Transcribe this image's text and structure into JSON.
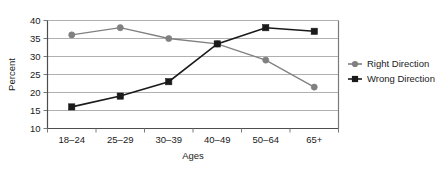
{
  "chart_data": {
    "type": "line",
    "title": "",
    "xlabel": "Ages",
    "ylabel": "Percent",
    "categories": [
      "18–24",
      "25–29",
      "30–39",
      "40–49",
      "50–64",
      "65+"
    ],
    "ylim": [
      10,
      40
    ],
    "ytick_step": 5,
    "yticks": [
      "10",
      "15",
      "20",
      "25",
      "30",
      "35",
      "40"
    ],
    "grid": "horizontal",
    "legend_position": "right",
    "series": [
      {
        "name": "Right Direction",
        "marker": "circle",
        "color": "#808080",
        "values": [
          36,
          38,
          35,
          33.5,
          29,
          21.5
        ]
      },
      {
        "name": "Wrong Direction",
        "marker": "square",
        "color": "#1a1a1a",
        "values": [
          16,
          19,
          23,
          33.5,
          38,
          37
        ]
      }
    ]
  },
  "legend": {
    "items": [
      {
        "label": "Right Direction",
        "marker": "circle-marker",
        "color": "#808080"
      },
      {
        "label": "Wrong Direction",
        "marker": "square-marker",
        "color": "#1a1a1a"
      }
    ]
  },
  "axes": {
    "y_title": "Percent",
    "x_title": "Ages"
  },
  "colors": {
    "background": "#ffffff",
    "grid": "#b0b0b0",
    "frame": "#7a7a7a",
    "text": "#1a1a1a",
    "right_direction": "#808080",
    "wrong_direction": "#1a1a1a"
  }
}
